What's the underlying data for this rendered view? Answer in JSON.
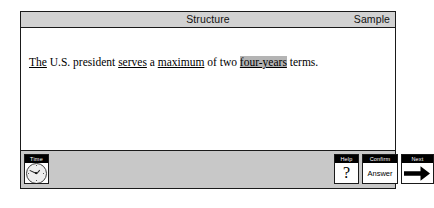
{
  "app": {
    "section_title": "Structure",
    "mode_label": "Sample"
  },
  "question": {
    "segments": [
      {
        "text": "The",
        "style": "underline"
      },
      {
        "text": " U.S. president ",
        "style": "plain"
      },
      {
        "text": "serves",
        "style": "underline"
      },
      {
        "text": " a ",
        "style": "plain"
      },
      {
        "text": "maximum",
        "style": "underline"
      },
      {
        "text": " of two ",
        "style": "plain"
      },
      {
        "text": "four-years",
        "style": "selected"
      },
      {
        "text": " terms.",
        "style": "plain"
      }
    ],
    "full_text": "The U.S. president serves a maximum of two four-years terms.",
    "selected_choice": "four-years"
  },
  "toolbar": {
    "time": {
      "cap_label": "Time",
      "icon": "analog-clock-icon"
    },
    "help": {
      "cap_label": "Help",
      "glyph": "?",
      "icon": "question-mark-icon"
    },
    "confirm": {
      "cap_label": "Confirm",
      "body_label": "Answer"
    },
    "next": {
      "cap_label": "Next",
      "icon": "arrow-right-icon"
    }
  },
  "colors": {
    "header_bar": "#d2d2d2",
    "toolbar_bar": "#c8c8c8",
    "highlight": "#b4b4b4",
    "frame": "#1a1a1a",
    "page": "#ffffff"
  }
}
